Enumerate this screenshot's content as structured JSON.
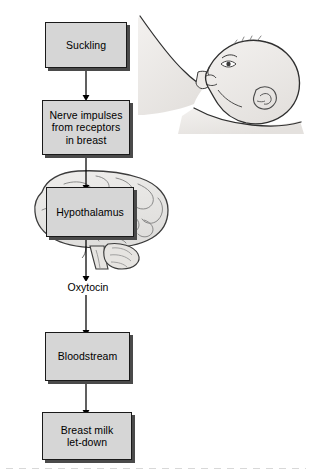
{
  "diagram": {
    "boxes": [
      {
        "id": "suckling",
        "label": "Suckling"
      },
      {
        "id": "nerve-impulses",
        "label": "Nerve impulses\nfrom receptors\nin breast"
      },
      {
        "id": "hypothalamus",
        "label": "Hypothalamus"
      },
      {
        "id": "bloodstream",
        "label": "Bloodstream"
      },
      {
        "id": "breast-milk",
        "label": "Breast milk\nlet-down"
      }
    ],
    "labels": [
      {
        "id": "oxytocin",
        "text": "Oxytocin"
      }
    ],
    "illustrations": [
      {
        "id": "breastfeeding-infant",
        "name": "infant-suckling-at-breast-illustration"
      },
      {
        "id": "brain",
        "name": "human-brain-lateral-view-illustration"
      }
    ],
    "colors": {
      "box_fill": "#d6d6d6",
      "box_border": "#1a1a1a",
      "box_shadow": "#4a4a4a",
      "art_fill": "#eceae8",
      "art_stroke": "#3a3a3a",
      "arrow": "#000000",
      "background": "#ffffff"
    }
  }
}
